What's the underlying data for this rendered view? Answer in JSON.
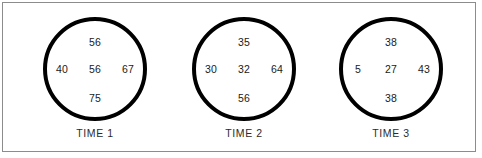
{
  "figure": {
    "type": "circle-number-diagram",
    "border_color": "#8c8c8c",
    "circle_stroke_color": "#000000",
    "text_color": "#1a1a1a",
    "background": "#ffffff"
  },
  "circles": [
    {
      "label": "TIME 1",
      "top": "56",
      "left": "40",
      "center": "56",
      "right": "67",
      "bottom": "75"
    },
    {
      "label": "TIME 2",
      "top": "35",
      "left": "30",
      "center": "32",
      "right": "64",
      "bottom": "56"
    },
    {
      "label": "TIME 3",
      "top": "38",
      "left": "5",
      "center": "27",
      "right": "43",
      "bottom": "38"
    }
  ],
  "chart_data": {
    "type": "table",
    "title": "",
    "xlabel": "",
    "ylabel": "",
    "categories": [
      "TIME 1",
      "TIME 2",
      "TIME 3"
    ],
    "positions": [
      "top",
      "left",
      "center",
      "right",
      "bottom"
    ],
    "series": [
      {
        "name": "top",
        "values": [
          56,
          35,
          38
        ]
      },
      {
        "name": "left",
        "values": [
          40,
          30,
          5
        ]
      },
      {
        "name": "center",
        "values": [
          56,
          32,
          27
        ]
      },
      {
        "name": "right",
        "values": [
          67,
          64,
          43
        ]
      },
      {
        "name": "bottom",
        "values": [
          75,
          56,
          38
        ]
      }
    ],
    "legend": []
  }
}
